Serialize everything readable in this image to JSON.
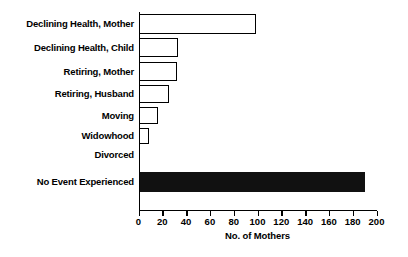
{
  "chart_data": {
    "type": "bar",
    "orientation": "horizontal",
    "title": "",
    "xlabel": "No. of Mothers",
    "ylabel": "",
    "xlim": [
      0,
      200
    ],
    "xticks": [
      0,
      20,
      40,
      60,
      80,
      100,
      120,
      140,
      160,
      180,
      200
    ],
    "grid": false,
    "legend": null,
    "categories": [
      "Declining Health, Mother",
      "Declining Health, Child",
      "Retiring, Mother",
      "Retiring, Husband",
      "Moving",
      "Widowhood",
      "Divorced",
      "No Event Experienced"
    ],
    "values": [
      99,
      33,
      32,
      26,
      16,
      9,
      0,
      190
    ],
    "bar_styles": [
      "open",
      "open",
      "open",
      "open",
      "open",
      "open",
      "open",
      "filled"
    ],
    "colors": {
      "open_fill": "#ffffff",
      "open_edge": "#000000",
      "filled_fill": "#111111",
      "axis": "#000000"
    }
  },
  "axis": {
    "x_title": "No. of Mothers",
    "tick_labels": [
      "0",
      "20",
      "40",
      "60",
      "80",
      "100",
      "120",
      "140",
      "160",
      "180",
      "200"
    ]
  },
  "bottom_artifact": ""
}
